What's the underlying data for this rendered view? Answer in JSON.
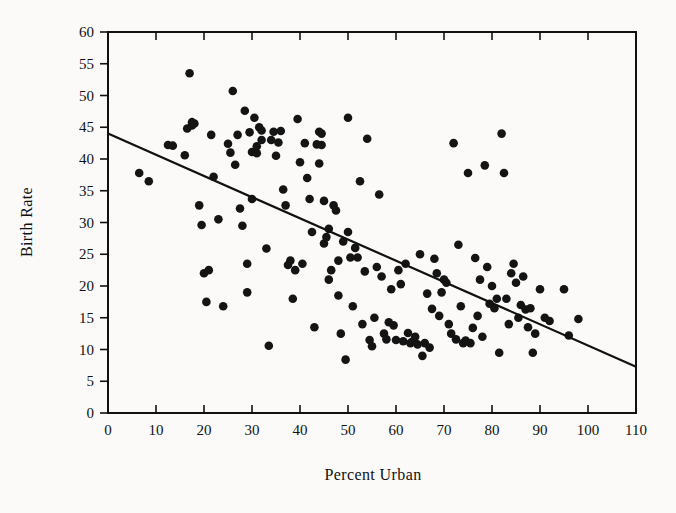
{
  "chart_data": {
    "type": "scatter",
    "title": "",
    "xlabel": "Percent Urban",
    "ylabel": "Birth Rate",
    "xlim": [
      0,
      110
    ],
    "ylim": [
      0,
      60
    ],
    "xticks": [
      0,
      10,
      20,
      30,
      40,
      50,
      60,
      70,
      80,
      90,
      100,
      110
    ],
    "yticks": [
      0,
      5,
      10,
      15,
      20,
      25,
      30,
      35,
      40,
      45,
      50,
      55,
      60
    ],
    "grid": false,
    "legend": null,
    "marker": "filled-circle",
    "marker_color": "#141414",
    "background_color": "#fbfaf8",
    "frame_color": "#111111",
    "trendline": {
      "type": "linear-fit",
      "x_start": 0,
      "y_start": 44.0,
      "x_end": 110,
      "y_end": 7.3,
      "slope": -0.3336,
      "intercept": 44.0,
      "color": "#111111"
    },
    "x": [
      6.5,
      8.5,
      12.5,
      13.5,
      16.0,
      16.5,
      17.0,
      17.5,
      17.5,
      18.0,
      19.0,
      19.5,
      20.0,
      20.5,
      21.0,
      21.5,
      22.0,
      23.0,
      24.0,
      25.0,
      25.5,
      26.0,
      26.5,
      27.0,
      27.5,
      28.0,
      28.5,
      29.0,
      29.0,
      29.5,
      30.0,
      30.0,
      30.5,
      31.0,
      31.0,
      31.5,
      32.0,
      32.0,
      33.0,
      33.5,
      34.0,
      34.5,
      35.0,
      35.5,
      36.0,
      36.5,
      37.0,
      37.5,
      38.0,
      38.5,
      39.0,
      39.5,
      40.0,
      40.5,
      41.0,
      41.5,
      42.0,
      42.5,
      43.0,
      43.5,
      44.0,
      44.0,
      44.5,
      44.5,
      45.0,
      45.0,
      45.5,
      46.0,
      46.0,
      46.5,
      47.0,
      47.5,
      48.0,
      48.0,
      48.5,
      49.0,
      49.5,
      50.0,
      50.0,
      50.5,
      51.0,
      51.5,
      52.0,
      52.5,
      53.0,
      53.5,
      54.0,
      54.5,
      55.0,
      55.5,
      56.0,
      56.5,
      57.0,
      57.5,
      58.0,
      58.5,
      59.0,
      59.5,
      60.0,
      60.5,
      61.0,
      61.5,
      62.0,
      62.5,
      63.0,
      63.5,
      64.0,
      64.5,
      65.0,
      65.5,
      66.0,
      66.5,
      67.0,
      67.5,
      68.0,
      68.5,
      69.0,
      69.5,
      70.0,
      70.5,
      71.0,
      71.5,
      72.0,
      72.5,
      73.0,
      73.5,
      74.0,
      74.5,
      75.0,
      75.5,
      76.0,
      76.5,
      77.0,
      77.5,
      78.0,
      78.5,
      79.0,
      79.5,
      80.0,
      80.5,
      81.0,
      81.5,
      82.0,
      82.5,
      83.0,
      83.5,
      84.0,
      84.5,
      85.0,
      85.5,
      86.0,
      86.5,
      87.0,
      87.5,
      88.0,
      88.5,
      89.0,
      90.0,
      91.0,
      92.0,
      95.0,
      96.0,
      98.0
    ],
    "y": [
      37.8,
      36.5,
      42.2,
      42.1,
      40.6,
      44.8,
      53.5,
      45.3,
      45.8,
      45.6,
      32.7,
      29.6,
      22.0,
      17.5,
      22.5,
      43.8,
      37.2,
      30.5,
      16.8,
      42.4,
      41.0,
      50.7,
      39.1,
      43.8,
      32.2,
      29.5,
      47.6,
      23.5,
      19.0,
      44.2,
      41.1,
      33.7,
      46.5,
      42.0,
      40.9,
      45.0,
      44.5,
      43.0,
      25.9,
      10.6,
      43.0,
      44.3,
      40.5,
      42.6,
      44.4,
      35.2,
      32.7,
      23.3,
      24.0,
      18.0,
      22.5,
      46.3,
      39.5,
      23.5,
      42.5,
      37.0,
      33.7,
      28.5,
      13.5,
      42.3,
      44.3,
      39.3,
      44.0,
      42.2,
      33.4,
      26.7,
      27.7,
      29.0,
      21.0,
      22.5,
      32.7,
      31.9,
      18.5,
      24.0,
      12.5,
      27.0,
      8.4,
      46.5,
      28.5,
      24.5,
      16.8,
      26.0,
      24.5,
      36.5,
      14.0,
      22.3,
      43.2,
      11.5,
      10.5,
      15.0,
      23.0,
      34.4,
      21.5,
      12.5,
      11.6,
      14.3,
      19.5,
      13.8,
      11.5,
      22.5,
      20.3,
      11.3,
      23.5,
      12.6,
      11.0,
      11.3,
      12.0,
      10.8,
      25.0,
      9.0,
      11.0,
      18.8,
      10.3,
      16.4,
      24.3,
      22.0,
      15.3,
      19.0,
      21.0,
      20.5,
      14.0,
      12.5,
      42.5,
      11.6,
      26.5,
      16.8,
      11.0,
      11.4,
      37.8,
      11.0,
      13.4,
      24.4,
      15.3,
      21.0,
      12.0,
      39.0,
      23.0,
      17.2,
      20.0,
      16.5,
      18.0,
      9.5,
      44.0,
      37.8,
      18.0,
      14.0,
      22.0,
      23.5,
      20.5,
      15.0,
      17.0,
      21.5,
      16.3,
      13.5,
      16.5,
      9.5,
      12.5,
      19.5,
      15.0,
      14.5,
      19.5,
      12.2,
      14.8
    ]
  }
}
